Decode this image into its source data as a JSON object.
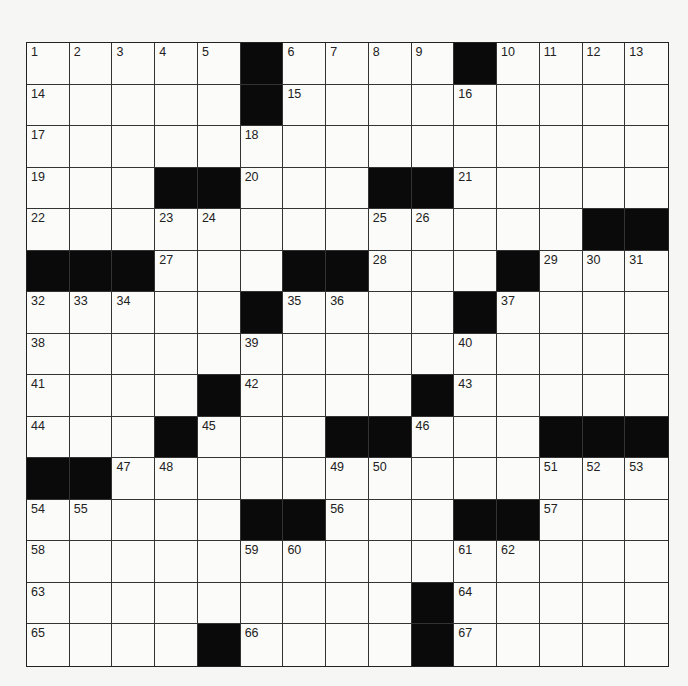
{
  "puzzle": {
    "rows": 15,
    "cols": 15,
    "grid": [
      [
        "1",
        "2",
        "3",
        "4",
        "5",
        "#",
        "6",
        "7",
        "8",
        "9",
        "#",
        "10",
        "11",
        "12",
        "13"
      ],
      [
        "14",
        "",
        "",
        "",
        "",
        "#",
        "15",
        "",
        "",
        "",
        "16",
        "",
        "",
        "",
        ""
      ],
      [
        "17",
        "",
        "",
        "",
        "",
        "18",
        "",
        "",
        "",
        "",
        "",
        "",
        "",
        "",
        ""
      ],
      [
        "19",
        "",
        "",
        "#",
        "#",
        "20",
        "",
        "",
        "#",
        "#",
        "21",
        "",
        "",
        "",
        ""
      ],
      [
        "22",
        "",
        "",
        "23",
        "24",
        "",
        "",
        "",
        "25",
        "26",
        "",
        "",
        "",
        "#",
        "#"
      ],
      [
        "#",
        "#",
        "#",
        "27",
        "",
        "",
        "#",
        "#",
        "28",
        "",
        "",
        "#",
        "29",
        "30",
        "31"
      ],
      [
        "32",
        "33",
        "34",
        "",
        "",
        "#",
        "35",
        "36",
        "",
        "",
        "#",
        "37",
        "",
        "",
        ""
      ],
      [
        "38",
        "",
        "",
        "",
        "",
        "39",
        "",
        "",
        "",
        "",
        "40",
        "",
        "",
        "",
        ""
      ],
      [
        "41",
        "",
        "",
        "",
        "#",
        "42",
        "",
        "",
        "",
        "#",
        "43",
        "",
        "",
        "",
        ""
      ],
      [
        "44",
        "",
        "",
        "#",
        "45",
        "",
        "",
        "#",
        "#",
        "46",
        "",
        "",
        "#",
        "#",
        "#"
      ],
      [
        "#",
        "#",
        "47",
        "48",
        "",
        "",
        "",
        "49",
        "50",
        "",
        "",
        "",
        "51",
        "52",
        "53"
      ],
      [
        "54",
        "55",
        "",
        "",
        "",
        "#",
        "#",
        "56",
        "",
        "",
        "#",
        "#",
        "57",
        "",
        ""
      ],
      [
        "58",
        "",
        "",
        "",
        "",
        "59",
        "60",
        "",
        "",
        "",
        "61",
        "62",
        "",
        "",
        ""
      ],
      [
        "63",
        "",
        "",
        "",
        "",
        "",
        "",
        "",
        "",
        "#",
        "64",
        "",
        "",
        "",
        ""
      ],
      [
        "65",
        "",
        "",
        "",
        "#",
        "66",
        "",
        "",
        "",
        "#",
        "67",
        "",
        "",
        "",
        ""
      ]
    ]
  },
  "colors": {
    "black_cell": "#0a0a0a",
    "white_cell": "#fbfbf9",
    "grid_line": "#333333",
    "background": "#f6f6f4"
  }
}
